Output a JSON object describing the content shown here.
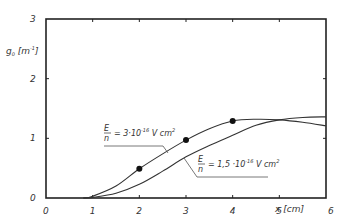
{
  "chart_data": {
    "type": "line",
    "title": "",
    "xlabel": "x [cm]",
    "ylabel": "g_0 [m^-1]",
    "xlim": [
      0,
      6
    ],
    "ylim": [
      0,
      3
    ],
    "x_ticks": [
      "0",
      "1",
      "2",
      "3",
      "4",
      "5",
      "6"
    ],
    "y_ticks": [
      "0",
      "1",
      "2",
      "3"
    ],
    "grid": false,
    "legend": "inline annotations",
    "series": [
      {
        "name": "E/n = 3·10^-16 V cm^2",
        "style": "line",
        "x": [
          0.8,
          1.0,
          1.5,
          2.0,
          2.5,
          3.0,
          3.5,
          4.0,
          4.5,
          5.0,
          5.5,
          6.0
        ],
        "values": [
          0.0,
          0.03,
          0.2,
          0.49,
          0.74,
          0.97,
          1.16,
          1.29,
          1.32,
          1.31,
          1.27,
          1.21
        ]
      },
      {
        "name": "E/n = 1.5·10^-16 V cm^2",
        "style": "line",
        "x": [
          0.8,
          1.0,
          1.5,
          2.0,
          2.5,
          3.0,
          3.5,
          4.0,
          4.5,
          5.0,
          5.5,
          6.0
        ],
        "values": [
          0.0,
          0.01,
          0.08,
          0.23,
          0.45,
          0.69,
          0.88,
          1.05,
          1.22,
          1.31,
          1.35,
          1.36
        ]
      },
      {
        "name": "measured points",
        "style": "scatter",
        "x": [
          2,
          3,
          4
        ],
        "values": [
          0.49,
          0.97,
          1.29
        ]
      }
    ],
    "annotations": [
      {
        "text_main": "E",
        "text_den": "n",
        "text_rest": "= 3·10",
        "exp": "-16",
        "unit": "V cm",
        "unit_exp": "2",
        "target_series": 0
      },
      {
        "text_main": "E",
        "text_den": "n",
        "text_rest": "= 1,5 ·10",
        "exp": "-16",
        "unit": "V cm",
        "unit_exp": "2",
        "target_series": 1
      }
    ]
  },
  "labels": {
    "ylabel_main": "g",
    "ylabel_sub": "0",
    "ylabel_unit": "[m",
    "ylabel_exp": "-1",
    "ylabel_close": "]",
    "xlabel": "x [cm]"
  }
}
